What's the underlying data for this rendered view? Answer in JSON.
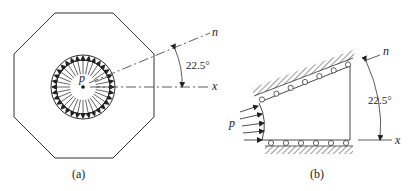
{
  "figure_a": {
    "caption": "(a)",
    "pressure_label": "p",
    "angle_label": "22.5°",
    "axis_n_label": "n",
    "axis_x_label": "x"
  },
  "figure_b": {
    "caption": "(b)",
    "pressure_label": "p",
    "angle_label": "22.5°",
    "axis_n_label": "n",
    "axis_x_label": "x"
  },
  "colors": {
    "stroke": "#333333",
    "background": "#ffffff"
  }
}
